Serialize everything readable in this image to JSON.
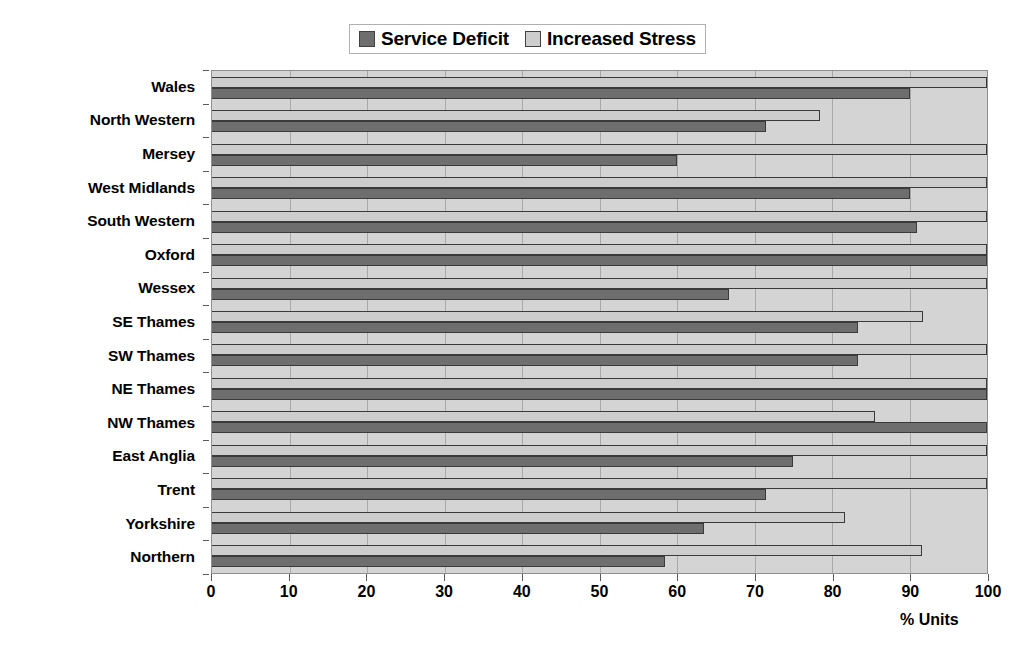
{
  "chart_data": {
    "type": "bar",
    "orientation": "horizontal",
    "title": "",
    "xlabel": "% Units",
    "ylabel": "",
    "xlim": [
      0,
      100
    ],
    "xticks": [
      0,
      10,
      20,
      30,
      40,
      50,
      60,
      70,
      80,
      90,
      100
    ],
    "xtick_labels": [
      "0",
      "10",
      "20",
      "30",
      "40",
      "50",
      "60",
      "70",
      "80",
      "90",
      "100"
    ],
    "grid": true,
    "grid_axis": "x",
    "legend_position": "top-center",
    "categories": [
      "Wales",
      "North Western",
      "Mersey",
      "West Midlands",
      "South Western",
      "Oxford",
      "Wessex",
      "SE Thames",
      "SW Thames",
      "NE Thames",
      "NW Thames",
      "East Anglia",
      "Trent",
      "Yorkshire",
      "Northern"
    ],
    "series": [
      {
        "name": "Service Deficit",
        "color": "#6e6e6e",
        "values": [
          90,
          71.5,
          60,
          90,
          91,
          100,
          66.7,
          83.3,
          83.3,
          100,
          100,
          75,
          71.5,
          63.5,
          58.5
        ]
      },
      {
        "name": "Increased Stress",
        "color": "#cdcdcd",
        "values": [
          100,
          78.5,
          100,
          100,
          100,
          100,
          100,
          91.7,
          100,
          100,
          85.6,
          100,
          100,
          81.7,
          91.6
        ]
      }
    ]
  },
  "legend": {
    "entries": [
      {
        "label": "Service Deficit"
      },
      {
        "label": "Increased Stress"
      }
    ]
  },
  "axis": {
    "x_title": "% Units"
  }
}
